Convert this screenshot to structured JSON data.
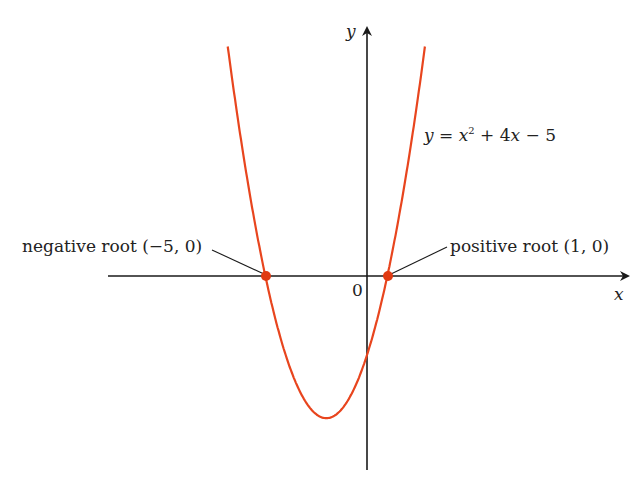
{
  "chart_data": {
    "type": "line",
    "title": "",
    "equation": "y = x² + 4x − 5",
    "xlabel": "x",
    "ylabel": "y",
    "origin_label": "0",
    "annotations": [
      {
        "text": "negative root (−5, 0)",
        "x": -5,
        "y": 0
      },
      {
        "text": "positive root (1, 0)",
        "x": 1,
        "y": 0
      }
    ],
    "series": [
      {
        "name": "y = x² + 4x − 5",
        "function": "x^2+4x-5",
        "color": "#e8451e",
        "x": [
          -7,
          -6,
          -5,
          -4,
          -3,
          -2,
          -1,
          0,
          1,
          2,
          3
        ],
        "values": [
          16,
          7,
          0,
          -5,
          -8,
          -9,
          -8,
          -5,
          0,
          7,
          16
        ]
      }
    ],
    "points": [
      {
        "x": -5,
        "y": 0
      },
      {
        "x": 1,
        "y": 0
      }
    ],
    "vertex": {
      "x": -2,
      "y": -9
    },
    "y_intercept": -5,
    "grid": false
  },
  "labels": {
    "y_axis": "y",
    "x_axis": "x",
    "origin": "0",
    "eq_y": "y",
    "eq_eq": " = ",
    "eq_x": "x",
    "eq_sup": "2",
    "eq_rest1": " + 4",
    "eq_x2": "x",
    "eq_rest2": " − 5",
    "neg_root": "negative root (−5, 0)",
    "pos_root": "positive root (1, 0)"
  },
  "colors": {
    "curve": "#e8451e",
    "axis": "#1a1a1a",
    "point": "#e03a12"
  }
}
